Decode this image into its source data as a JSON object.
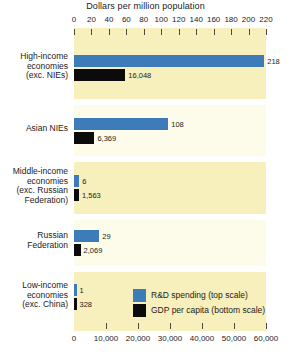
{
  "chart_data": {
    "type": "bar",
    "title": "Dollars per million population",
    "orientation": "horizontal",
    "categories": [
      "High-income economies (exc. NIEs)",
      "Asian NIEs",
      "Middle-income economies (exc. Russian Federation)",
      "Russian Federation",
      "Low-income economies (exc. China)"
    ],
    "series": [
      {
        "name": "R&D spending (top scale)",
        "color": "#3d7cb8",
        "axis": "top",
        "values": [
          218,
          108,
          6,
          29,
          1
        ],
        "value_labels": [
          "218",
          "108",
          "6",
          "29",
          "1"
        ]
      },
      {
        "name": "GDP per capita (bottom scale)",
        "color": "#0b0b0b",
        "axis": "bottom",
        "values": [
          16048,
          6369,
          1563,
          2069,
          328
        ],
        "value_labels": [
          "16,048",
          "6,369",
          "1,563",
          "2,069",
          "328"
        ]
      }
    ],
    "top_axis": {
      "label": "Dollars per million population",
      "ticks": [
        0,
        20,
        40,
        60,
        80,
        100,
        120,
        140,
        160,
        180,
        200,
        220
      ],
      "tick_labels": [
        "0",
        "20",
        "40",
        "60",
        "80",
        "100",
        "120",
        "140",
        "160",
        "180",
        "200",
        "220"
      ],
      "range": [
        0,
        220
      ]
    },
    "bottom_axis": {
      "ticks": [
        0,
        10000,
        20000,
        30000,
        40000,
        50000,
        60000
      ],
      "tick_labels": [
        "0",
        "10,000",
        "20,000",
        "30,000",
        "40,000",
        "50,000",
        "60,000"
      ],
      "range": [
        0,
        60000
      ]
    },
    "legend": {
      "position": "inside-bottom-right",
      "entries": [
        {
          "label": "R&D spending (top scale)",
          "color": "#3d7cb8"
        },
        {
          "label": "GDP per capita (bottom scale)",
          "color": "#0b0b0b"
        }
      ]
    },
    "grid": false,
    "band_colors": [
      "#f7f0bc",
      "#fdfbe9"
    ]
  },
  "rows": [
    {
      "label_lines": [
        "High-income",
        "economies",
        "(exc. NIEs)"
      ],
      "blue_label": "218",
      "black_label": "16,048"
    },
    {
      "label_lines": [
        "Asian NIEs"
      ],
      "blue_label": "108",
      "black_label": "6,369"
    },
    {
      "label_lines": [
        "Middle-income",
        "economies",
        "(exc. Russian",
        "Federation)"
      ],
      "blue_label": "6",
      "black_label": "1,563"
    },
    {
      "label_lines": [
        "Russian",
        "Federation"
      ],
      "blue_label": "29",
      "black_label": "2,069"
    },
    {
      "label_lines": [
        "Low-income",
        "economies",
        "(exc. China)"
      ],
      "blue_label": "1",
      "black_label": "328"
    }
  ],
  "legend": {
    "rd_label": "R&D spending (top scale)",
    "gdp_label": "GDP per capita (bottom scale)"
  },
  "axis_title": "Dollars per million population"
}
